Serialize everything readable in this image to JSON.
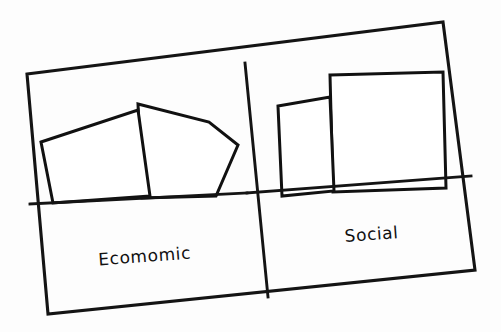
{
  "figure": {
    "kind": "hand-drawn-sketch",
    "background_color": "#fdfdfd",
    "ink_color": "#141414",
    "hatch_color": "#6f6f6f",
    "width": 501,
    "height": 332
  },
  "panels": [
    {
      "id": "left",
      "label": "Ecomomic",
      "label_x": 145,
      "label_y": 262,
      "label_rotation": -4.2
    },
    {
      "id": "right",
      "label": "Social",
      "label_x": 372,
      "label_y": 240,
      "label_rotation": -4.2
    }
  ],
  "chart_data": {
    "type": "bar",
    "title": "",
    "subtitle": "",
    "xlabel": "",
    "ylabel": "",
    "grid": false,
    "legend": null,
    "axis_tick_labels": [],
    "annotations": [],
    "categories": [
      "Ecomomic",
      "Social"
    ],
    "series": [
      {
        "name": "bar-1",
        "values": [
          78,
          62
        ],
        "note": "left/front bar of each panel, relative height units"
      },
      {
        "name": "bar-2",
        "values": [
          84,
          100
        ],
        "note": "right/back bar of each panel, relative height units"
      }
    ],
    "ylim": [
      0,
      110
    ]
  },
  "shapes": {
    "frame_outer": "M27,74 L443,22 L475,270 L48,314 Z",
    "divider_vertical": "M245,63 L268,297",
    "baseline_left": "M30,204 L247,193",
    "baseline_right": "M247,193 L471,176",
    "left_bar_1": "M41,142 L138,110 L150,196 L53,203 Z",
    "left_bar_2": "M138,104 L209,122 L238,145 L216,196 L142,198 Z",
    "right_bar_1": "M278,106 L330,97 L334,191 L282,196 Z",
    "right_bar_2": "M330,75 L443,72 L446,188 L333,192 Z"
  },
  "hatching": {
    "left_bar_1_lines": 14,
    "left_bar_2_lines": 9,
    "right_bar_1_lines": 9,
    "right_bar_2_lines": 19,
    "orientation": "vertical"
  }
}
